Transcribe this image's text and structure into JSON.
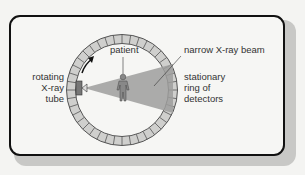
{
  "diagram": {
    "labels": {
      "patient": "patient",
      "beam": "narrow X-ray beam",
      "tube_line1": "rotating",
      "tube_line2": "X-ray",
      "tube_line3": "tube",
      "detectors_line1": "stationary",
      "detectors_line2": "ring of",
      "detectors_line3": "detectors"
    },
    "colors": {
      "frame_border": "#111111",
      "ring_fill": "#cfcfcd",
      "ring_stroke": "#555555",
      "beam_fill": "#9e9e9c",
      "tube_fill": "#777777",
      "figure_fill": "#888888"
    },
    "ring_segments": 40
  }
}
